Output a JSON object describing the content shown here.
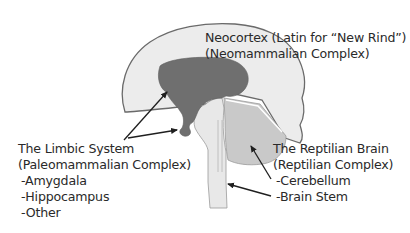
{
  "diagram": {
    "colors": {
      "background": "#ffffff",
      "neocortex_fill": "#ececec",
      "outline": "#6a6a6a",
      "limbic_fill": "#6f6f6f",
      "reptilian_fill": "#c9c9c9",
      "brainstem_fill": "#e8e8e8",
      "text": "#2a2a2a",
      "arrow": "#1f1f1f"
    },
    "labels": {
      "neocortex": {
        "line1": "Neocortex (Latin for “New Rind”)",
        "line2": "(Neomammalian Complex)"
      },
      "limbic": {
        "line1": "The Limbic System",
        "line2": "(Paleomammalian Complex)",
        "items": [
          "-Amygdala",
          "-Hippocampus",
          "-Other"
        ]
      },
      "reptilian": {
        "line1": "The Reptilian Brain",
        "line2": "(Reptilian Complex)",
        "items": [
          "-Cerebellum",
          "-Brain Stem"
        ]
      }
    }
  }
}
